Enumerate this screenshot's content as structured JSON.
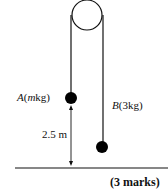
{
  "diagram": {
    "type": "pulley-system",
    "pulley": {
      "cx": 87,
      "cy": 15,
      "r": 15
    },
    "mass_a": {
      "letter": "A",
      "mass": "m",
      "unit": "kg",
      "label": "A(mkg)"
    },
    "mass_b": {
      "letter": "B",
      "mass": "3",
      "unit": "kg",
      "label": "B(3kg)"
    },
    "height_label": "2.5 m",
    "colors": {
      "line": "#111111",
      "ball": "#000000"
    }
  },
  "footer": {
    "marks": "(3 marks)"
  }
}
